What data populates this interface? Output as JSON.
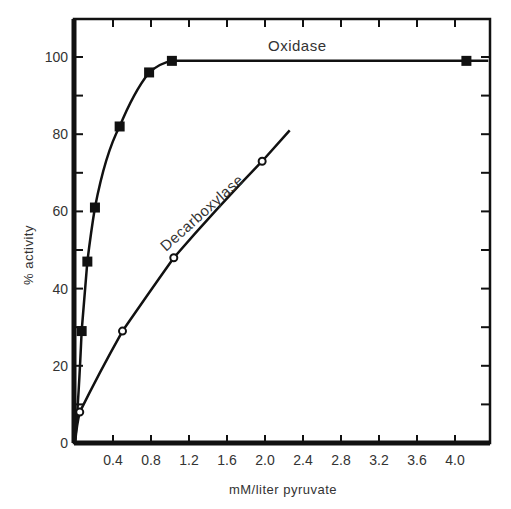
{
  "chart_data": {
    "type": "line",
    "title": "",
    "xlabel": "mM/liter pyruvate",
    "ylabel": "% activity",
    "xlim": [
      0,
      4.4
    ],
    "ylim": [
      0,
      110
    ],
    "x_ticks": [
      "0.4",
      "0.8",
      "1.2",
      "1.6",
      "2.0",
      "2.4",
      "2.8",
      "3.2",
      "3.6",
      "4.0"
    ],
    "y_ticks": [
      "0",
      "20",
      "40",
      "60",
      "80",
      "100"
    ],
    "grid": false,
    "legend": "inline labels",
    "series": [
      {
        "name": "Oxidase",
        "marker": "filled-square",
        "x": [
          0.07,
          0.13,
          0.21,
          0.47,
          0.78,
          1.02,
          4.12
        ],
        "y": [
          29,
          47,
          61,
          82,
          96,
          99,
          99
        ]
      },
      {
        "name": "Decarboxylase",
        "marker": "open-circle",
        "x": [
          0.05,
          0.5,
          1.04,
          1.97
        ],
        "y": [
          8,
          29,
          48,
          73
        ],
        "curve_extends_to": [
          2.26,
          81
        ]
      }
    ]
  },
  "labels": {
    "xlabel": "mM/liter pyruvate",
    "ylabel": "% activity",
    "oxidase": "Oxidase",
    "decarboxylase": "Decarboxylase"
  },
  "colors": {
    "ink": "#111111",
    "background": "#ffffff"
  }
}
